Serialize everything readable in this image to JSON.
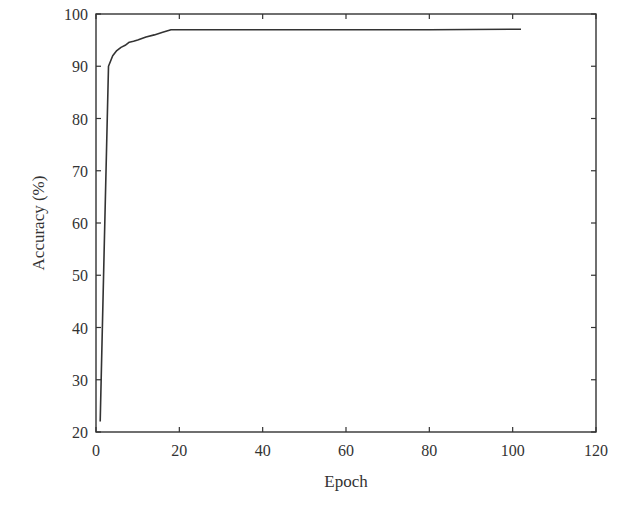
{
  "chart_data": {
    "type": "line",
    "title": "",
    "xlabel": "Epoch",
    "ylabel": "Accuracy (%)",
    "xlim": [
      0,
      120
    ],
    "ylim": [
      20,
      100
    ],
    "xticks": [
      0,
      20,
      40,
      60,
      80,
      100,
      120
    ],
    "yticks": [
      20,
      30,
      40,
      50,
      60,
      70,
      80,
      90,
      100
    ],
    "grid": false,
    "legend": null,
    "series": [
      {
        "name": "Accuracy",
        "color": "#333333",
        "x": [
          1,
          2,
          3,
          4,
          5,
          6,
          7,
          8,
          9,
          10,
          12,
          14,
          16,
          18,
          20,
          40,
          60,
          80,
          100,
          102
        ],
        "y": [
          22,
          56,
          90,
          92,
          93,
          93.6,
          94,
          94.6,
          94.8,
          95,
          95.6,
          96,
          96.5,
          97,
          97,
          97,
          97,
          97,
          97.1,
          97.1
        ]
      }
    ]
  }
}
